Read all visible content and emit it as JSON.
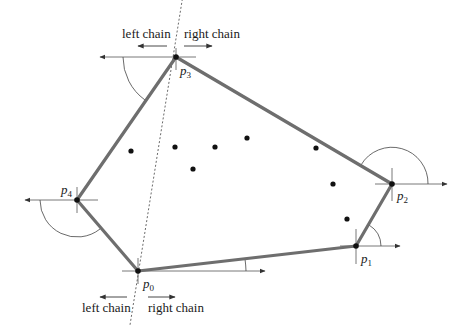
{
  "diagram": {
    "colors": {
      "hull_edge": "#6e6e6e",
      "thin_line": "#555555",
      "point": "#111111",
      "text": "#1a1a1a"
    },
    "hull_vertices": [
      {
        "id": "p0",
        "label": "p",
        "sub": "0",
        "x": 138,
        "y": 271
      },
      {
        "id": "p1",
        "label": "p",
        "sub": "1",
        "x": 356,
        "y": 246
      },
      {
        "id": "p2",
        "label": "p",
        "sub": "2",
        "x": 392,
        "y": 184
      },
      {
        "id": "p3",
        "label": "p",
        "sub": "3",
        "x": 176,
        "y": 57
      },
      {
        "id": "p4",
        "label": "p",
        "sub": "4",
        "x": 77,
        "y": 200
      }
    ],
    "interior_points": [
      {
        "x": 131,
        "y": 151
      },
      {
        "x": 175,
        "y": 147
      },
      {
        "x": 215,
        "y": 147
      },
      {
        "x": 247,
        "y": 138
      },
      {
        "x": 193,
        "y": 169
      },
      {
        "x": 316,
        "y": 148
      },
      {
        "x": 333,
        "y": 184
      },
      {
        "x": 347,
        "y": 219
      }
    ],
    "top_labels": {
      "left": "left chain",
      "right": "right chain"
    },
    "bottom_labels": {
      "left": "left chain",
      "right": "right chain"
    }
  }
}
